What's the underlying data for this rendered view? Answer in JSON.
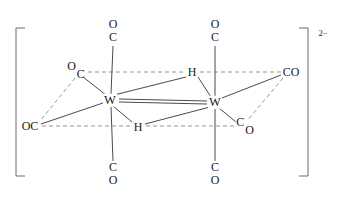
{
  "figure": {
    "kind": "chemical-structure-diagram",
    "name": "ditungsten carbonyl dihydride dianion",
    "charge_label": "2−",
    "background_color": "#ffffff",
    "bond_color": "#555555",
    "text_color": "#1a1a1a"
  },
  "metals": [
    {
      "id": "W1",
      "label": "W",
      "x": 110,
      "y": 100
    },
    {
      "id": "W2",
      "label": "W",
      "x": 215,
      "y": 102
    }
  ],
  "bridging_hydrides": [
    {
      "id": "H-top",
      "label": "H",
      "x": 192,
      "y": 72
    },
    {
      "id": "H-bottom",
      "label": "H",
      "x": 138,
      "y": 127
    }
  ],
  "carbonyls": [
    {
      "id": "CO-top-left",
      "layout": "vertical",
      "top": "O",
      "bottom": "C",
      "x": 113,
      "y": 31,
      "c_x": 113,
      "c_y": 40
    },
    {
      "id": "CO-top-right",
      "layout": "vertical",
      "top": "O",
      "bottom": "C",
      "x": 215,
      "y": 31,
      "c_x": 215,
      "c_y": 40
    },
    {
      "id": "CO-bottom-left",
      "layout": "vertical",
      "top": "C",
      "bottom": "O",
      "x": 113,
      "y": 174,
      "c_x": 113,
      "c_y": 167
    },
    {
      "id": "CO-bottom-right",
      "layout": "vertical",
      "top": "C",
      "bottom": "O",
      "x": 215,
      "y": 174,
      "c_x": 215,
      "c_y": 167
    },
    {
      "id": "OC-upper-left",
      "layout": "stagger-up",
      "first": "O",
      "second": "C",
      "x": 76,
      "y": 68,
      "c_x": 81,
      "c_y": 72
    },
    {
      "id": "OC-left",
      "layout": "horizontal",
      "text": "OC",
      "x": 30,
      "y": 126,
      "c_x": 37,
      "c_y": 126
    },
    {
      "id": "CO-upper-right",
      "layout": "horizontal",
      "text": "CO",
      "x": 291,
      "y": 72,
      "c_x": 285,
      "c_y": 72
    },
    {
      "id": "CO-lower-right",
      "layout": "stagger-down",
      "first": "C",
      "second": "O",
      "x": 245,
      "y": 128,
      "c_x": 240,
      "c_y": 125
    }
  ],
  "bonds": [
    {
      "from": "W1",
      "to": "W2",
      "style": "double-solid",
      "desc": "metal-metal bond"
    },
    {
      "from": "W1",
      "to": "H-top",
      "style": "solid"
    },
    {
      "from": "W2",
      "to": "H-top",
      "style": "solid"
    },
    {
      "from": "W1",
      "to": "H-bottom",
      "style": "solid"
    },
    {
      "from": "W2",
      "to": "H-bottom",
      "style": "solid"
    },
    {
      "from": "W1",
      "to": "CO-top-left",
      "style": "solid"
    },
    {
      "from": "W1",
      "to": "CO-bottom-left",
      "style": "solid"
    },
    {
      "from": "W2",
      "to": "CO-top-right",
      "style": "solid"
    },
    {
      "from": "W2",
      "to": "CO-bottom-right",
      "style": "solid"
    },
    {
      "from": "W1",
      "to": "OC-upper-left",
      "style": "solid"
    },
    {
      "from": "W1",
      "to": "OC-left",
      "style": "solid"
    },
    {
      "from": "W2",
      "to": "CO-upper-right",
      "style": "solid"
    },
    {
      "from": "W2",
      "to": "CO-lower-right",
      "style": "solid"
    },
    {
      "from": "OC-upper-left",
      "to": "H-top",
      "style": "dashed",
      "desc": "octahedron edge"
    },
    {
      "from": "H-top",
      "to": "CO-upper-right",
      "style": "dashed",
      "desc": "octahedron edge"
    },
    {
      "from": "OC-left",
      "to": "H-bottom",
      "style": "dashed",
      "desc": "octahedron edge"
    },
    {
      "from": "H-bottom",
      "to": "CO-lower-right",
      "style": "dashed",
      "desc": "octahedron edge"
    },
    {
      "from": "OC-upper-left",
      "to": "OC-left",
      "style": "dashed",
      "desc": "octahedron edge"
    },
    {
      "from": "CO-upper-right",
      "to": "CO-lower-right",
      "style": "dashed",
      "desc": "octahedron edge"
    }
  ],
  "brackets": {
    "left": {
      "x": 16,
      "top": 28,
      "bottom": 176,
      "arm": 9
    },
    "right": {
      "x": 308,
      "top": 28,
      "bottom": 176,
      "arm": 9
    },
    "charge": {
      "text": "2−",
      "x": 323,
      "y": 33
    }
  }
}
